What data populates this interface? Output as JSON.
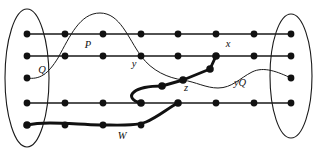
{
  "figure": {
    "background_color": "#ffffff",
    "ink_color": "#111111"
  },
  "labels": [
    {
      "id": "P",
      "text": "P",
      "x": 88,
      "y": 48,
      "size": "normal"
    },
    {
      "id": "Q",
      "text": "Q",
      "x": 42,
      "y": 73,
      "size": "normal"
    },
    {
      "id": "y",
      "text": "y",
      "x": 134,
      "y": 67,
      "size": "normal"
    },
    {
      "id": "x",
      "text": "x",
      "x": 228,
      "y": 47,
      "size": "normal"
    },
    {
      "id": "z",
      "text": "z",
      "x": 186,
      "y": 91,
      "size": "normal"
    },
    {
      "id": "yQ",
      "text": "yQ",
      "x": 240,
      "y": 86,
      "size": "normal"
    },
    {
      "id": "W",
      "text": "W",
      "x": 122,
      "y": 139,
      "size": "normal"
    }
  ],
  "left_set": {
    "name": "left-vertex-group",
    "ellipse": {
      "cx": 27,
      "cy": 78,
      "rx": 22,
      "ry": 69
    },
    "vertices": [
      {
        "x": 27,
        "y": 34
      },
      {
        "x": 27,
        "y": 56
      },
      {
        "x": 27,
        "y": 78
      },
      {
        "x": 27,
        "y": 103
      },
      {
        "x": 27,
        "y": 125
      }
    ]
  },
  "right_set": {
    "name": "right-vertex-group",
    "ellipse": {
      "cx": 291,
      "cy": 76,
      "rx": 21,
      "ry": 62
    },
    "vertices": [
      {
        "x": 291,
        "y": 34
      },
      {
        "x": 291,
        "y": 56
      },
      {
        "x": 291,
        "y": 78
      },
      {
        "x": 291,
        "y": 103
      }
    ]
  },
  "rails": [
    {
      "id": "rail-1",
      "y": 34,
      "x1": 27,
      "x2": 291,
      "vertices_x": [
        27,
        65,
        103,
        141,
        178,
        216,
        254,
        291
      ]
    },
    {
      "id": "rail-2",
      "y": 56,
      "x1": 27,
      "x2": 291,
      "vertices_x": [
        27,
        65,
        103,
        141,
        178,
        216,
        254,
        291
      ]
    },
    {
      "id": "rail-3",
      "y": 103,
      "x1": 27,
      "x2": 291,
      "vertices_x": [
        27,
        65,
        103,
        141,
        178,
        216,
        254,
        291
      ]
    }
  ],
  "curves": {
    "Q": {
      "label": "Q",
      "description": "thin curve from left third vertex arcing over P rail and down through y to z",
      "path": "M 27,78 C 40,80 48,74 58,58 C 70,36 80,13 100,13 C 120,13 128,38 141,56 C 152,71 168,78 183,80"
    },
    "yQ": {
      "label": "yQ",
      "description": "thin curve from z continuing right, dipping, then rising to right set third vertex",
      "path": "M 183,80 C 196,82 206,88 218,88 C 232,88 240,78 252,72 C 264,66 278,72 291,78"
    },
    "W": {
      "label": "W",
      "description": "thick path from left bottom vertex right along bottom, up to rail-3, zig-zag up to x",
      "segments": [
        "M 27,125 C 45,121 70,124 100,125 C 120,125 136,126 146,122 C 158,117 168,108 178,103",
        "M 141,103 C 132,101 130,96 134,92 C 140,87 152,86 162,86",
        "M 162,86 L 183,80",
        "M 183,80 L 210,69",
        "M 210,69 L 216,56"
      ]
    }
  },
  "thick_path_vertices": [
    {
      "id": "w-start",
      "x": 27,
      "y": 125
    },
    {
      "id": "w-b",
      "x": 65,
      "y": 125
    },
    {
      "id": "w-c",
      "x": 103,
      "y": 125
    },
    {
      "id": "w-d",
      "x": 141,
      "y": 125
    },
    {
      "id": "w-rail3a",
      "x": 141,
      "y": 103
    },
    {
      "id": "w-rail3b",
      "x": 178,
      "y": 103
    },
    {
      "id": "w-mid",
      "x": 162,
      "y": 86
    },
    {
      "id": "z-node",
      "x": 183,
      "y": 80
    },
    {
      "id": "bend",
      "x": 210,
      "y": 69
    },
    {
      "id": "x-node",
      "x": 216,
      "y": 56
    }
  ]
}
